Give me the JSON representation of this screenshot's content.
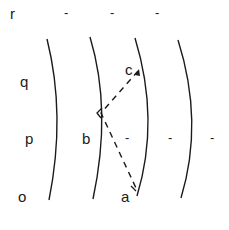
{
  "diagram": {
    "row_labels": [
      {
        "text": "r",
        "x": 10,
        "y": 6
      },
      {
        "text": "q",
        "x": 20,
        "y": 74
      },
      {
        "text": "p",
        "x": 25,
        "y": 131
      },
      {
        "text": "o",
        "x": 18,
        "y": 189
      }
    ],
    "point_labels": [
      {
        "text": "c",
        "x": 125,
        "y": 62
      },
      {
        "text": "b",
        "x": 82,
        "y": 131
      },
      {
        "text": "a",
        "x": 121,
        "y": 189
      }
    ],
    "dashes": [
      {
        "text": "-",
        "x": 64,
        "y": 6
      },
      {
        "text": "-",
        "x": 110,
        "y": 6
      },
      {
        "text": "-",
        "x": 155,
        "y": 6
      },
      {
        "text": "-",
        "x": 125,
        "y": 131
      },
      {
        "text": "-",
        "x": 168,
        "y": 131
      },
      {
        "text": "-",
        "x": 210,
        "y": 131
      }
    ],
    "curves": [
      "M47,39 Q66,115 49,200",
      "M90,37 Q112,110 93,199",
      "M135,38 Q160,120 137,196",
      "M178,40 Q204,122 181,198"
    ],
    "dashed_path": "M138,71 L101,113 L136,188",
    "points": [
      {
        "name": "c",
        "x": 138,
        "y": 71
      },
      {
        "name": "b",
        "x": 101,
        "y": 113
      },
      {
        "name": "a",
        "x": 136,
        "y": 188
      }
    ],
    "stroke_color": "#1a1a1a"
  }
}
